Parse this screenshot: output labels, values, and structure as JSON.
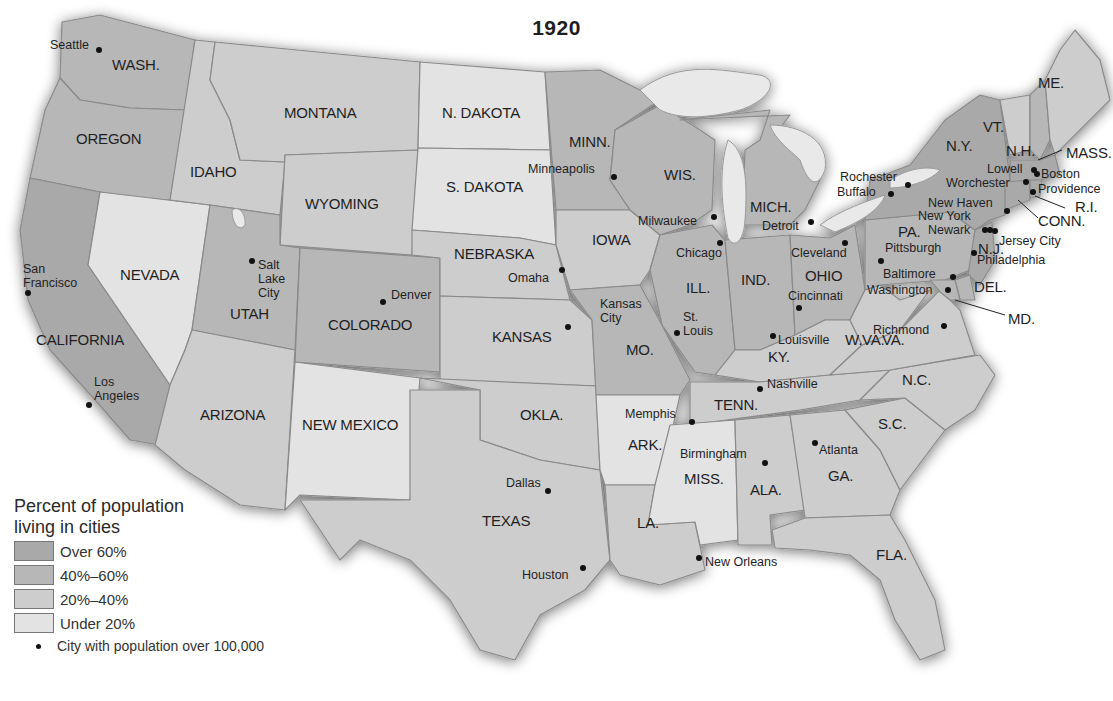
{
  "title": "1920",
  "colors": {
    "over_60": "#a9a9a9",
    "p40_60": "#b7b7b7",
    "p20_40": "#cdcdcd",
    "under_20": "#e3e3e3",
    "lakes": "#e9e9e9",
    "background": "#ffffff"
  },
  "legend": {
    "title_line1": "Percent of population",
    "title_line2": "living in cities",
    "items": [
      {
        "label": "Over 60%",
        "color": "#a9a9a9"
      },
      {
        "label": "40%–60%",
        "color": "#b7b7b7"
      },
      {
        "label": "20%–40%",
        "color": "#cdcdcd"
      },
      {
        "label": "Under 20%",
        "color": "#e3e3e3"
      }
    ],
    "city_symbol_label": "City with population over 100,000"
  },
  "states": {
    "wash": "WASH.",
    "oregon": "OREGON",
    "california": "CALIFORNIA",
    "idaho": "IDAHO",
    "nevada": "NEVADA",
    "montana": "MONTANA",
    "wyoming": "WYOMING",
    "utah": "UTAH",
    "colorado": "COLORADO",
    "arizona": "ARIZONA",
    "new_mexico": "NEW MEXICO",
    "n_dakota": "N. DAKOTA",
    "s_dakota": "S. DAKOTA",
    "nebraska": "NEBRASKA",
    "kansas": "KANSAS",
    "okla": "OKLA.",
    "texas": "TEXAS",
    "minn": "MINN.",
    "iowa": "IOWA",
    "mo": "MO.",
    "ark": "ARK.",
    "la": "LA.",
    "wis": "WIS.",
    "ill": "ILL.",
    "mich": "MICH.",
    "ind": "IND.",
    "ohio": "OHIO",
    "ky": "KY.",
    "tenn": "TENN.",
    "miss": "MISS.",
    "ala": "ALA.",
    "ga": "GA.",
    "fla": "FLA.",
    "sc": "S.C.",
    "nc": "N.C.",
    "va": "VA.",
    "wva": "W.VA.",
    "pa": "PA.",
    "ny": "N.Y.",
    "vt": "VT.",
    "nh": "N.H.",
    "me": "ME.",
    "mass": "MASS.",
    "ri": "R.I.",
    "conn": "CONN.",
    "nj": "N.J.",
    "del": "DEL.",
    "md": "MD."
  },
  "cities": {
    "seattle": "Seattle",
    "san_francisco_1": "San",
    "san_francisco_2": "Francisco",
    "los_angeles_1": "Los",
    "los_angeles_2": "Angeles",
    "salt_lake_1": "Salt",
    "salt_lake_2": "Lake",
    "salt_lake_3": "City",
    "denver": "Denver",
    "minneapolis": "Minneapolis",
    "omaha": "Omaha",
    "kansas_city_1": "Kansas",
    "kansas_city_2": "City",
    "dallas": "Dallas",
    "houston": "Houston",
    "milwaukee": "Milwaukee",
    "chicago": "Chicago",
    "st_louis_1": "St.",
    "st_louis_2": "Louis",
    "memphis": "Memphis",
    "new_orleans": "New Orleans",
    "detroit": "Detroit",
    "cleveland": "Cleveland",
    "cincinnati": "Cincinnati",
    "louisville": "Louisville",
    "nashville": "Nashville",
    "birmingham": "Birmingham",
    "atlanta": "Atlanta",
    "pittsburgh": "Pittsburgh",
    "buffalo": "Buffalo",
    "rochester": "Rochester",
    "baltimore": "Baltimore",
    "washington": "Washington",
    "richmond": "Richmond",
    "philadelphia": "Philadelphia",
    "newark": "Newark",
    "new_york": "New York",
    "jersey_city": "Jersey City",
    "new_haven": "New Haven",
    "providence": "Providence",
    "worchester": "Worchester",
    "boston": "Boston",
    "lowell": "Lowell"
  }
}
